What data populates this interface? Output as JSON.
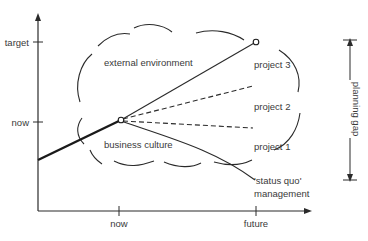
{
  "diagram": {
    "y_axis": {
      "ticks": [
        {
          "label": "target",
          "y": 42
        },
        {
          "label": "now",
          "y": 122
        }
      ]
    },
    "x_axis": {
      "ticks": [
        {
          "label": "now",
          "x": 119
        },
        {
          "label": "future",
          "x": 256
        }
      ]
    },
    "cloud_labels": {
      "external": "external environment",
      "business": "business culture"
    },
    "paths": {
      "project3": "project 3",
      "project2": "project 2",
      "project1": "project 1",
      "status_quo_line1": "'status quo'",
      "status_quo_line2": "management"
    },
    "planning_gap": "planning gap",
    "colors": {
      "line": "#2a2a2a",
      "text": "#3a3a3a",
      "background": "#ffffff"
    }
  }
}
